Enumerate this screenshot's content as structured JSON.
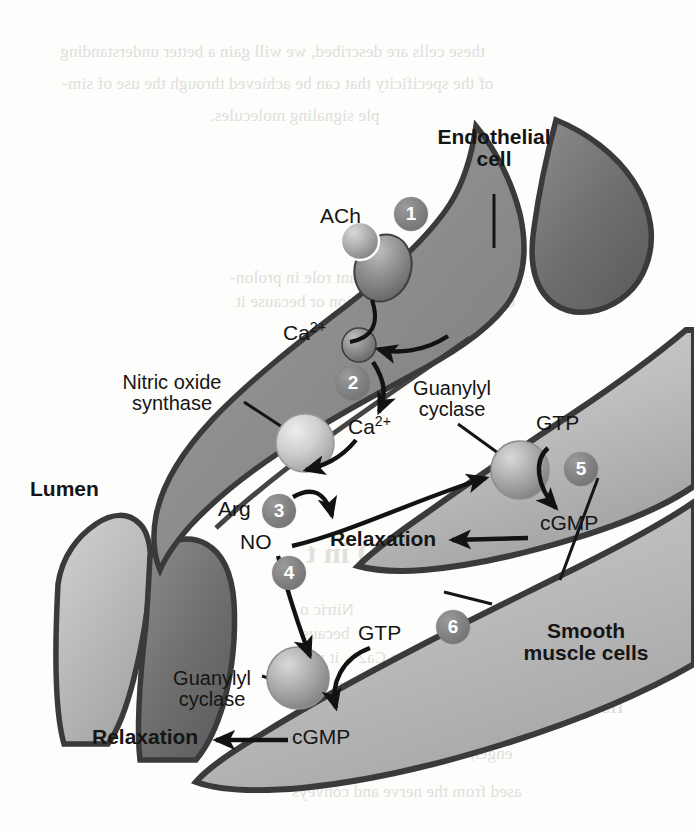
{
  "figure": {
    "type": "biological-pathway-diagram"
  },
  "labels": {
    "endothelial_cell": "Endothelial\ncell",
    "endothelial_cell_line1": "Endothelial",
    "endothelial_cell_line2": "cell",
    "lumen": "Lumen",
    "smooth_muscle_cells_line1": "Smooth",
    "smooth_muscle_cells_line2": "muscle cells",
    "nitric_oxide_synthase_line1": "Nitric oxide",
    "nitric_oxide_synthase_line2": "synthase",
    "guanylyl_cyclase_upper_line1": "Guanylyl",
    "guanylyl_cyclase_upper_line2": "cyclase",
    "guanylyl_cyclase_lower_line1": "Guanylyl",
    "guanylyl_cyclase_lower_line2": "cyclase"
  },
  "molecules": {
    "ach": "ACh",
    "calcium_outside": "Ca",
    "calcium_outside_charge": "2+",
    "calcium_inside": "Ca",
    "calcium_inside_charge": "2+",
    "arginine": "Arg",
    "nitric_oxide": "NO",
    "gtp_upper": "GTP",
    "cgmp_upper": "cGMP",
    "gtp_lower": "GTP",
    "cgmp_lower": "cGMP"
  },
  "outcomes": {
    "relaxation_upper": "Relaxation",
    "relaxation_lower": "Relaxation"
  },
  "steps": [
    {
      "number": "1",
      "描述": "ACh binds receptor on endothelial cell"
    },
    {
      "number": "2",
      "描述": "Ca2+ enters endothelial cell"
    },
    {
      "number": "3",
      "描述": "Nitric oxide synthase converts Arg to NO"
    },
    {
      "number": "4",
      "描述": "NO diffuses to smooth muscle cell"
    },
    {
      "number": "5",
      "描述": "Guanylyl cyclase converts GTP to cGMP"
    },
    {
      "number": "6",
      "描述": "cGMP causes relaxation"
    }
  ],
  "step_numbers": [
    "1",
    "2",
    "3",
    "4",
    "5",
    "6"
  ],
  "colors": {
    "endothelial_fill": "#8c8c8c",
    "smooth_muscle_fill": "#b9b9b9",
    "dark_cell_fill": "#6f6f6f",
    "outline": "#3a3a3a",
    "step_badge": "#7e7e7e",
    "text": "#151515",
    "background": "#fdfdfb"
  },
  "bleed_through": {
    "top_line1": "these cells are described, we will gain a better understanding",
    "top_line2": "of the specificity that can be achieved through the use of sim-",
    "top_line3": "ple signaling molecules.",
    "mid_line1": "play such an important role in prolon-",
    "mid_line2": "ecause of its concentration or because it",
    "section_heading": "NO in t",
    "bottom_line1": "Nitric o",
    "bottom_line2": "becaus",
    "bottom_line3": "as Ca2+, it was",
    "bottom_line4": "unusual because it acts as a",
    "bottom_line5": "mediating intercellular comm",
    "bottom_line6": "enger, acting within the cell in",
    "bottom_line7": "ased from the nerve and conveys",
    "bottom_right1": "er",
    "bottom_right2": "ns",
    "bottom_right3": "NO is"
  }
}
